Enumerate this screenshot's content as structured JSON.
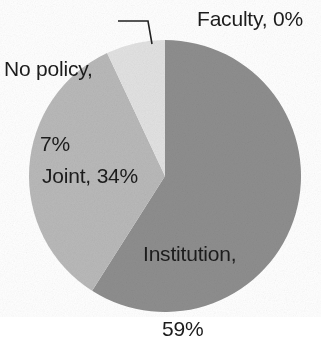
{
  "chart_data": {
    "type": "pie",
    "title": "",
    "subtitle": "",
    "xlabel": "",
    "ylabel": "",
    "legend_position": "none",
    "grid": false,
    "unit": "%",
    "categories": [
      "Institution",
      "Joint",
      "No policy",
      "Faculty"
    ],
    "values": [
      59,
      34,
      7,
      0
    ],
    "slices": [
      {
        "name": "Institution",
        "label": "Institution,",
        "label_line2": "59%",
        "full_label": "Institution, 59%",
        "value": 59,
        "color": "#8e8e8e",
        "start_angle_deg": 0,
        "sweep_deg": 212.4,
        "label_placement": "inside"
      },
      {
        "name": "Joint",
        "label": "Joint, 34%",
        "full_label": "Joint, 34%",
        "value": 34,
        "color": "#b9b9b9",
        "start_angle_deg": 212.4,
        "sweep_deg": 122.4,
        "label_placement": "inside"
      },
      {
        "name": "No policy",
        "label": "No policy,",
        "label_line2": "7%",
        "full_label": "No policy, 7%",
        "value": 7,
        "color": "#e2e2e2",
        "start_angle_deg": 334.8,
        "sweep_deg": 25.2,
        "label_placement": "outside-leader"
      },
      {
        "name": "Faculty",
        "label": "Faculty, 0%",
        "full_label": "Faculty, 0%",
        "value": 0,
        "color": "#8e8e8e",
        "start_angle_deg": 0,
        "sweep_deg": 0,
        "label_placement": "outside"
      }
    ]
  },
  "labels": {
    "no_policy_line1": "No policy,",
    "no_policy_line2": "7%",
    "faculty": "Faculty, 0%",
    "joint": "Joint, 34%",
    "institution_line1": "Institution,",
    "institution_line2": "59%"
  },
  "colors": {
    "institution": "#8e8e8e",
    "joint": "#b9b9b9",
    "no_policy": "#e2e2e2",
    "text": "#1c1c1c",
    "leader_line": "#222222",
    "background": "#ffffff"
  },
  "geometry": {
    "center_x": 165,
    "center_y": 176,
    "radius": 136
  }
}
